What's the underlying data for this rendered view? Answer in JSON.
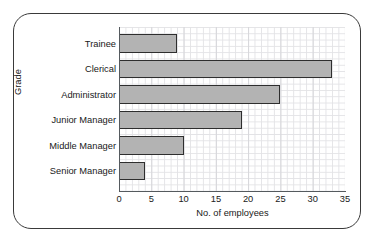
{
  "chart_data": {
    "type": "bar",
    "orientation": "horizontal",
    "title": "",
    "xlabel": "No. of employees",
    "ylabel": "Grade",
    "categories": [
      "Trainee",
      "Clerical",
      "Administrator",
      "Junior Manager",
      "Middle Manager",
      "Senior Manager"
    ],
    "values": [
      9,
      33,
      25,
      19,
      10,
      4
    ],
    "xlim": [
      0,
      35
    ],
    "xticks": [
      "0",
      "5",
      "10",
      "15",
      "20",
      "25",
      "30",
      "35"
    ],
    "xtick_values": [
      0,
      5,
      10,
      15,
      20,
      25,
      30,
      35
    ],
    "grid": true,
    "legend": "none",
    "bar_fill_color": "#b3b3b3",
    "bar_edge_color": "#2e2e2e",
    "grid_color": "#e3e3e6",
    "axis_color": "#555a5e",
    "frame_color": "#3a3a3a",
    "background_color": "#ffffff"
  }
}
